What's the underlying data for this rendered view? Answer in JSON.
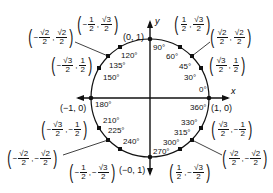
{
  "axes": {
    "x_label": "x",
    "y_label": "y"
  },
  "angles": [
    {
      "deg": "0°",
      "x": 199,
      "y": 86
    },
    {
      "deg": "30°",
      "x": 184,
      "y": 74
    },
    {
      "deg": "45°",
      "x": 179,
      "y": 63
    },
    {
      "deg": "60°",
      "x": 166,
      "y": 53
    },
    {
      "deg": "90°",
      "x": 153,
      "y": 44
    },
    {
      "deg": "120°",
      "x": 121,
      "y": 52
    },
    {
      "deg": "135°",
      "x": 109,
      "y": 62
    },
    {
      "deg": "150°",
      "x": 103,
      "y": 74
    },
    {
      "deg": "180°",
      "x": 95,
      "y": 101
    },
    {
      "deg": "210°",
      "x": 103,
      "y": 117
    },
    {
      "deg": "225°",
      "x": 108,
      "y": 127
    },
    {
      "deg": "240°",
      "x": 123,
      "y": 138
    },
    {
      "deg": "270°",
      "x": 153,
      "y": 148
    },
    {
      "deg": "300°",
      "x": 163,
      "y": 139
    },
    {
      "deg": "315°",
      "x": 174,
      "y": 129
    },
    {
      "deg": "330°",
      "x": 181,
      "y": 119
    },
    {
      "deg": "360°",
      "x": 190,
      "y": 104
    }
  ],
  "simple_coords": [
    {
      "text": "(0, 1)",
      "x": 123,
      "y": 33
    },
    {
      "text": "(−1, 0)",
      "x": 60,
      "y": 104
    },
    {
      "text": "(1, 0)",
      "x": 211,
      "y": 104
    },
    {
      "text": "(−0, 1)",
      "x": 119,
      "y": 166
    }
  ],
  "frac_coords": [
    {
      "name": "coord-60",
      "x": 173,
      "y": 14,
      "a": {
        "sign": "",
        "n": "1",
        "d": "2"
      },
      "b": {
        "sign": "",
        "n": "√3",
        "d": "2"
      }
    },
    {
      "name": "coord-45",
      "x": 209,
      "y": 27,
      "a": {
        "sign": "",
        "n": "√2",
        "d": "2"
      },
      "b": {
        "sign": "",
        "n": "√2",
        "d": "2"
      }
    },
    {
      "name": "coord-30",
      "x": 208,
      "y": 55,
      "a": {
        "sign": "",
        "n": "√3",
        "d": "2"
      },
      "b": {
        "sign": "",
        "n": "1",
        "d": "2"
      }
    },
    {
      "name": "coord-120",
      "x": 76,
      "y": 14,
      "a": {
        "sign": "−",
        "n": "1",
        "d": "2"
      },
      "b": {
        "sign": "",
        "n": "√3",
        "d": "2"
      }
    },
    {
      "name": "coord-135",
      "x": 27,
      "y": 27,
      "a": {
        "sign": "−",
        "n": "√2",
        "d": "2"
      },
      "b": {
        "sign": "",
        "n": "√2",
        "d": "2"
      }
    },
    {
      "name": "coord-150",
      "x": 50,
      "y": 55,
      "a": {
        "sign": "−",
        "n": "√3",
        "d": "2"
      },
      "b": {
        "sign": "",
        "n": "1",
        "d": "2"
      }
    },
    {
      "name": "coord-210",
      "x": 40,
      "y": 119,
      "a": {
        "sign": "−",
        "n": "√3",
        "d": "2"
      },
      "b": {
        "sign": "−",
        "n": "1",
        "d": "2"
      }
    },
    {
      "name": "coord-225",
      "x": 6,
      "y": 148,
      "a": {
        "sign": "−",
        "n": "√2",
        "d": "2"
      },
      "b": {
        "sign": "−",
        "n": "√2",
        "d": "2"
      }
    },
    {
      "name": "coord-240",
      "x": 68,
      "y": 162,
      "a": {
        "sign": "−",
        "n": "1",
        "d": "2"
      },
      "b": {
        "sign": "−",
        "n": "√3",
        "d": "2"
      }
    },
    {
      "name": "coord-300",
      "x": 168,
      "y": 162,
      "a": {
        "sign": "",
        "n": "1",
        "d": "2"
      },
      "b": {
        "sign": "−",
        "n": "√3",
        "d": "2"
      }
    },
    {
      "name": "coord-315",
      "x": 221,
      "y": 148,
      "a": {
        "sign": "",
        "n": "√2",
        "d": "2"
      },
      "b": {
        "sign": "−",
        "n": "√2",
        "d": "2"
      }
    },
    {
      "name": "coord-330",
      "x": 210,
      "y": 119,
      "a": {
        "sign": "",
        "n": "√3",
        "d": "2"
      },
      "b": {
        "sign": "−",
        "n": "1",
        "d": "2"
      }
    }
  ]
}
